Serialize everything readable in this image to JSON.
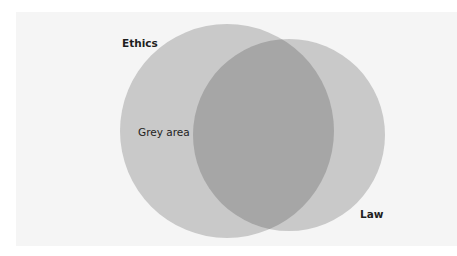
{
  "diagram": {
    "type": "venn",
    "sets": [
      {
        "name": "Ethics",
        "color": "#c9c9c9"
      },
      {
        "name": "Law",
        "color": "#c9c9c9"
      }
    ],
    "intersection_color": "#a6a6a6",
    "labels": {
      "ethics": "Ethics",
      "law": "Law",
      "grey_area": "Grey area"
    }
  }
}
